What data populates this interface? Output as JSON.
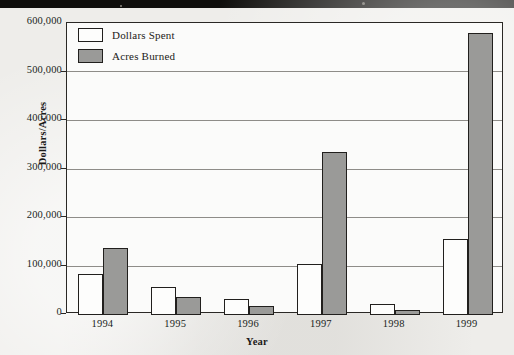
{
  "chart_data": {
    "type": "bar",
    "title": "",
    "xlabel": "Year",
    "ylabel": "Dollars/Acres",
    "categories": [
      "1994",
      "1995",
      "1996",
      "1997",
      "1998",
      "1999"
    ],
    "series": [
      {
        "name": "Dollars Spent",
        "color": "#fdfdfc",
        "values": [
          82000,
          55000,
          30000,
          103000,
          20000,
          155000
        ]
      },
      {
        "name": "Acres Burned",
        "color": "#9a9a98",
        "values": [
          136000,
          36000,
          17000,
          334000,
          8000,
          580000
        ]
      }
    ],
    "ylim": [
      0,
      600000
    ],
    "ytick_labels": [
      "0",
      "100,000",
      "200,000",
      "300,000",
      "400,000",
      "500,000",
      "600,000"
    ],
    "ytick_values": [
      0,
      100000,
      200000,
      300000,
      400000,
      500000,
      600000
    ],
    "grid": true,
    "legend_position": "top-left"
  },
  "legend": {
    "entries": [
      {
        "label": "Dollars Spent",
        "swatch": "legend-swatch-dollars-spent"
      },
      {
        "label": "Acres Burned",
        "swatch": "legend-swatch-acres-burned"
      }
    ]
  },
  "axes": {
    "y_title": "Dollars/Acres",
    "x_title": "Year",
    "y_ticks": [
      "600,000",
      "500,000",
      "400,000",
      "300,000",
      "200,000",
      "100,000",
      "0"
    ],
    "x_ticks": [
      "1994",
      "1995",
      "1996",
      "1997",
      "1998",
      "1999"
    ]
  }
}
